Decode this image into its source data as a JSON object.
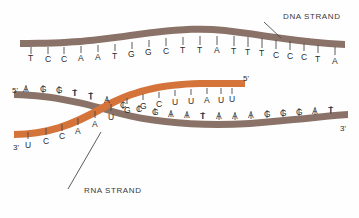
{
  "figure": {
    "background_color": "#fefefe",
    "dna_color": "#8a7268",
    "rna_color": "#d4733a",
    "text_color": "#2b2b2b"
  },
  "labels": {
    "dna_strand": "DNA STRAND",
    "rna_strand": "RNA STRAND"
  },
  "top_strand": {
    "name": "dna-template-top",
    "bases": [
      "T",
      "C",
      "C",
      "A",
      "A",
      "T",
      "G",
      "G",
      "C",
      "T",
      "T",
      "A",
      "T",
      "T",
      "T",
      "C",
      "C",
      "C",
      "T",
      "A"
    ],
    "x": [
      30,
      47,
      63,
      80,
      97,
      114,
      131,
      148,
      165,
      182,
      199,
      216,
      233,
      247,
      261,
      275,
      289,
      303,
      317,
      334
    ],
    "y": [
      56,
      57,
      57,
      56,
      55,
      54,
      52,
      51,
      50,
      50,
      50,
      50,
      51,
      52,
      53,
      54,
      55,
      56,
      57,
      58
    ],
    "tick_y": [
      42,
      42,
      42,
      41,
      40,
      39,
      37,
      36,
      35,
      35,
      35,
      35,
      36,
      37,
      38,
      39,
      40,
      41,
      42,
      43
    ]
  },
  "bottom_strand": {
    "name": "dna-coding-bottom",
    "five_prime": "5'",
    "three_prime": "3'",
    "bases": [
      "A",
      "G",
      "G",
      "T",
      "T",
      "A",
      "C",
      "C",
      "G",
      "A",
      "A",
      "T",
      "A",
      "A",
      "A",
      "G",
      "G",
      "G",
      "A",
      "T"
    ],
    "x": [
      25,
      42,
      58,
      74,
      90,
      106,
      122,
      138,
      154,
      170,
      186,
      202,
      218,
      234,
      250,
      266,
      282,
      298,
      314,
      330
    ],
    "y": [
      99,
      99,
      100,
      102,
      105,
      110,
      114,
      118,
      121,
      123,
      124,
      125,
      125,
      125,
      124,
      123,
      122,
      121,
      120,
      119
    ],
    "tick_y": [
      90,
      90,
      91,
      93,
      96,
      101,
      105,
      109,
      112,
      114,
      115,
      116,
      116,
      116,
      115,
      114,
      113,
      112,
      111,
      110
    ]
  },
  "rna_strand": {
    "name": "rna-transcript",
    "five_prime": "5'",
    "three_prime": "3'",
    "bases": [
      "U",
      "C",
      "C",
      "A",
      "A",
      "U",
      "G",
      "G",
      "C",
      "U",
      "U",
      "A",
      "U",
      "U"
    ],
    "x": [
      27,
      45,
      61,
      77,
      94,
      110,
      126,
      142,
      158,
      174,
      190,
      206,
      222,
      232
    ],
    "y": [
      143,
      138,
      134,
      128,
      122,
      115,
      108,
      104,
      101,
      99,
      97,
      96,
      95,
      94
    ]
  },
  "leaders": {
    "dna_leader": {
      "x1": 264,
      "y1": 22,
      "x2": 281,
      "y2": 38
    },
    "rna_leader": {
      "x1": 67,
      "y1": 190,
      "x2": 100,
      "y2": 133
    }
  }
}
